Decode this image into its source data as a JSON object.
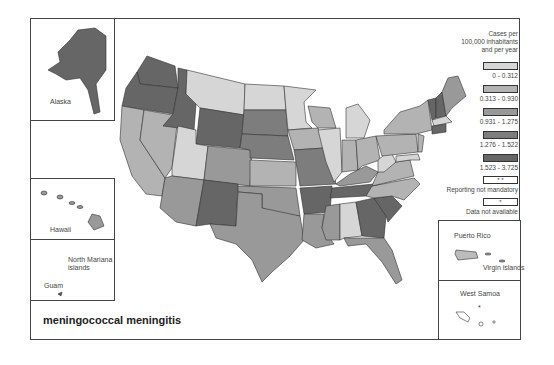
{
  "title": "meningococcal meningitis",
  "legend": {
    "heading": "Cases per 100,000 inhabitants and per year",
    "heading_lines": [
      "Cases per",
      "100,000 inhabitants",
      "and per year"
    ],
    "classes": [
      {
        "label": "0 - 0.312",
        "color": "#d6d6d6"
      },
      {
        "label": "0.313 - 0.930",
        "color": "#b3b3b3"
      },
      {
        "label": "0.931 - 1.275",
        "color": "#999999"
      },
      {
        "label": "1.276 - 1.522",
        "color": "#7d7d7d"
      },
      {
        "label": "1.523 - 3.725",
        "color": "#666666"
      }
    ],
    "special": [
      {
        "symbol": "* *",
        "label": "Reporting not mandatory"
      },
      {
        "symbol": "*",
        "label": "Data not available"
      }
    ]
  },
  "insets": {
    "alaska": "Alaska",
    "hawaii": "Hawaii",
    "north_mariana": [
      "North Mariana",
      "islands"
    ],
    "guam": "Guam",
    "puerto_rico": "Puerto Rico",
    "virgin_islands": "Virgin islands",
    "west_samoa": "West Samoa"
  }
}
